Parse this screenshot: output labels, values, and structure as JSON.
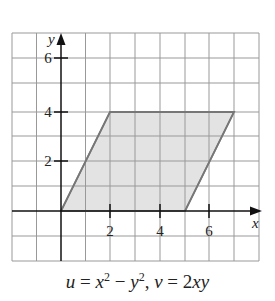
{
  "diagram": {
    "type": "region-plot",
    "axes": {
      "x_label": "x",
      "y_label": "y",
      "x_ticks": [
        "2",
        "4",
        "6"
      ],
      "y_ticks": [
        "2",
        "4",
        "6"
      ]
    },
    "region": {
      "shape": "parallelogram",
      "vertices": [
        [
          0,
          0
        ],
        [
          2,
          4
        ],
        [
          7,
          4
        ],
        [
          5,
          0
        ]
      ],
      "fill": "#e2e2e2",
      "stroke": "#777777"
    },
    "caption": "u = x² − y², v = 2xy",
    "caption_parts": {
      "u": "u",
      "eq1": " = ",
      "x": "x",
      "sup1": "2",
      "minus": " − ",
      "y": "y",
      "sup2": "2",
      "comma": ", ",
      "v": "v",
      "eq2": " = 2",
      "xy": "xy"
    }
  }
}
